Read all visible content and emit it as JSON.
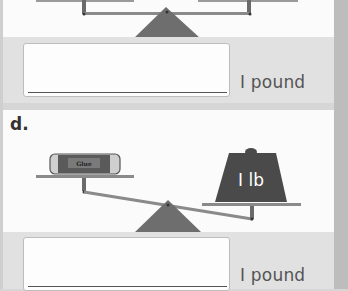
{
  "problems": [
    {
      "id": "c",
      "answer_value": "",
      "unit_label": "I pound",
      "scale": {
        "state": "balanced"
      }
    },
    {
      "id": "d",
      "label": "d.",
      "answer_value": "",
      "unit_label": "I pound",
      "scale": {
        "state": "right-heavy",
        "left_object": {
          "name": "glue stick",
          "label": "Glue"
        },
        "right_object": {
          "name": "weight",
          "label": "I lb"
        }
      }
    }
  ],
  "colors": {
    "scale_gray": "#7d7d7d",
    "fulcrum": "#6e6e6e",
    "weight": "#4a4a4a",
    "panel_white": "#fbfbfb",
    "panel_gray": "#e1e1e1"
  }
}
